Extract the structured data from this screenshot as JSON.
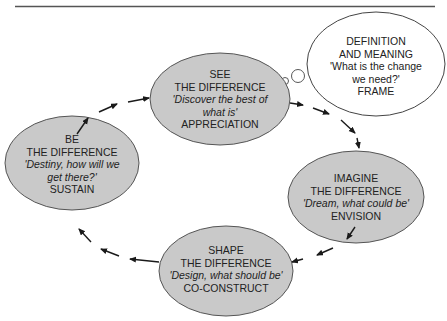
{
  "diagram": {
    "type": "cycle",
    "colors": {
      "node_fill": "#c9c9c9",
      "node_stroke": "#555555",
      "cloud_fill": "#ffffff",
      "arrow": "#1a1a1a",
      "rule": "#555555"
    },
    "nodes": [
      {
        "id": "see",
        "line1": "SEE",
        "line2": "THE DIFFERENCE",
        "quote1": "'Discover the best of",
        "quote2": "what is'",
        "label": "APPRECIATION"
      },
      {
        "id": "imagine",
        "line1": "IMAGINE",
        "line2": "THE DIFFERENCE",
        "quote1": "'Dream, what could be'",
        "label": "ENVISION"
      },
      {
        "id": "shape",
        "line1": "SHAPE",
        "line2": "THE DIFFERENCE",
        "quote1": "'Design, what should be'",
        "label": "CO-CONSTRUCT"
      },
      {
        "id": "be",
        "line1": "BE",
        "line2": "THE DIFFERENCE",
        "quote1": "'Destiny, how will we",
        "quote2": "get there?'",
        "label": "SUSTAIN"
      }
    ],
    "cloud": {
      "line1": "DEFINITION",
      "line2": "AND MEANING",
      "quote1": "'What is the change",
      "quote2": "we need?'",
      "label": "FRAME"
    },
    "flow": [
      "see",
      "imagine",
      "shape",
      "be",
      "see"
    ]
  }
}
